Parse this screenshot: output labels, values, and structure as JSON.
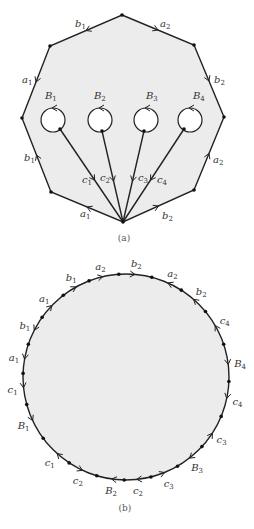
{
  "figure_a": {
    "caption": "(a)",
    "fill_color": "#ececec",
    "stroke_color": "#222222",
    "polygon_vertices": [
      [
        122,
        15
      ],
      [
        194,
        45
      ],
      [
        224,
        117
      ],
      [
        194,
        190
      ],
      [
        123,
        222
      ],
      [
        51,
        192
      ],
      [
        22,
        118
      ],
      [
        50,
        46
      ]
    ],
    "edges": [
      {
        "label": "b",
        "sub": "1",
        "from": 0,
        "to": 7,
        "lx": 75,
        "ly": 27
      },
      {
        "label": "a",
        "sub": "2",
        "from": 0,
        "to": 1,
        "lx": 160,
        "ly": 27
      },
      {
        "label": "a",
        "sub": "1",
        "from": 7,
        "to": 6,
        "lx": 22,
        "ly": 83
      },
      {
        "label": "b",
        "sub": "2",
        "from": 1,
        "to": 2,
        "lx": 214,
        "ly": 83
      },
      {
        "label": "b",
        "sub": "1",
        "from": 5,
        "to": 6,
        "lx": 24,
        "ly": 161
      },
      {
        "label": "a",
        "sub": "2",
        "from": 3,
        "to": 2,
        "lx": 213,
        "ly": 163
      },
      {
        "label": "a",
        "sub": "1",
        "from": 4,
        "to": 5,
        "lx": 80,
        "ly": 217
      },
      {
        "label": "b",
        "sub": "2",
        "from": 4,
        "to": 3,
        "lx": 162,
        "ly": 219
      }
    ],
    "boundaries": [
      {
        "label": "B",
        "sub": "1",
        "cx": 53,
        "cy": 120,
        "r": 12,
        "lx": 45,
        "ly": 99,
        "attach": [
          60,
          129
        ]
      },
      {
        "label": "B",
        "sub": "2",
        "cx": 100,
        "cy": 120,
        "r": 12,
        "lx": 94,
        "ly": 99,
        "attach": [
          102,
          131
        ]
      },
      {
        "label": "B",
        "sub": "3",
        "cx": 146,
        "cy": 120,
        "r": 12,
        "lx": 146,
        "ly": 99,
        "attach": [
          144,
          131
        ]
      },
      {
        "label": "B",
        "sub": "4",
        "cx": 190,
        "cy": 120,
        "r": 12,
        "lx": 193,
        "ly": 99,
        "attach": [
          184,
          129
        ]
      }
    ],
    "spokes": [
      {
        "label": "c",
        "sub": "1",
        "lx": 82,
        "ly": 183
      },
      {
        "label": "c",
        "sub": "2",
        "lx": 100,
        "ly": 181
      },
      {
        "label": "c",
        "sub": "3",
        "lx": 138,
        "ly": 181
      },
      {
        "label": "c",
        "sub": "4",
        "lx": 157,
        "ly": 183
      }
    ]
  },
  "figure_b": {
    "caption": "(b)",
    "circle": {
      "cx": 126,
      "cy": 377,
      "r": 103
    },
    "fill_color": "#ececec",
    "labels": [
      {
        "label": "b",
        "sub": "2",
        "angle": -85,
        "dir": 1
      },
      {
        "label": "a",
        "sub": "2",
        "angle": -66,
        "dir": -1
      },
      {
        "label": "b",
        "sub": "2",
        "angle": -49,
        "dir": -1
      },
      {
        "label": "c",
        "sub": "4",
        "angle": -30,
        "dir": -1
      },
      {
        "label": "B",
        "sub": "4",
        "angle": -7,
        "dir": 1
      },
      {
        "label": "c",
        "sub": "4",
        "angle": 12,
        "dir": 1
      },
      {
        "label": "c",
        "sub": "3",
        "angle": 33,
        "dir": -1
      },
      {
        "label": "B",
        "sub": "3",
        "angle": 52,
        "dir": 1
      },
      {
        "label": "c",
        "sub": "3",
        "angle": 68,
        "dir": -1
      },
      {
        "label": "c",
        "sub": "2",
        "angle": 84,
        "dir": 1
      },
      {
        "label": "B",
        "sub": "2",
        "angle": 98,
        "dir": 1
      },
      {
        "label": "c",
        "sub": "2",
        "angle": 115,
        "dir": -1
      },
      {
        "label": "c",
        "sub": "1",
        "angle": 132,
        "dir": 1
      },
      {
        "label": "B",
        "sub": "1",
        "angle": 155,
        "dir": -1
      },
      {
        "label": "c",
        "sub": "1",
        "angle": 174,
        "dir": -1
      },
      {
        "label": "a",
        "sub": "1",
        "angle": 190,
        "dir": -1
      },
      {
        "label": "b",
        "sub": "1",
        "angle": 207,
        "dir": -1
      },
      {
        "label": "a",
        "sub": "1",
        "angle": 224,
        "dir": 1
      },
      {
        "label": "b",
        "sub": "1",
        "angle": 241,
        "dir": 1
      },
      {
        "label": "a",
        "sub": "2",
        "angle": 257,
        "dir": 1
      }
    ]
  }
}
